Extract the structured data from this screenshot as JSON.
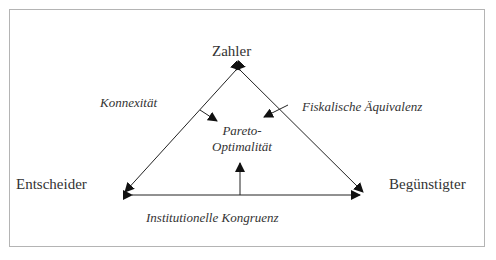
{
  "diagram": {
    "nodes": {
      "top": "Zahler",
      "left": "Entscheider",
      "right": "Begünstigter"
    },
    "criteria": {
      "left_side": "Konnexität",
      "right_side": "Fiskalische Äquivalenz",
      "base": "Institutionelle Kongruenz"
    },
    "center": {
      "line1": "Pareto-",
      "line2": "Optimalität"
    },
    "colors": {
      "line": "#222222",
      "frame": "#b4b4b4",
      "text": "#333333"
    }
  }
}
